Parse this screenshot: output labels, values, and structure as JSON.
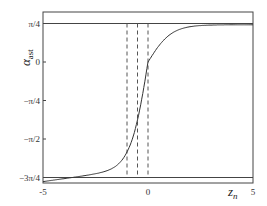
{
  "chart_data": {
    "type": "line",
    "title": "",
    "xlabel": "z_n",
    "ylabel": "α_ast",
    "xlim": [
      -5,
      5
    ],
    "ylim": [
      -2.55,
      0.95
    ],
    "x_ticks": [
      "-5",
      "0",
      "5"
    ],
    "y_ticks": [
      "π/4",
      "0",
      "−π/4",
      "−π/2",
      "−3π/4"
    ],
    "y_tick_values": [
      0.7854,
      0,
      -0.7854,
      -1.5708,
      -2.3562
    ],
    "horizontal_lines": [
      0.7854,
      -2.3562
    ],
    "vertical_dashed_lines": [
      -1.0,
      -0.5,
      0
    ],
    "series": [
      {
        "name": "alpha_ast",
        "x": [
          -5,
          -4,
          -3,
          -2,
          -1.5,
          -1,
          -0.5,
          0,
          0.5,
          1,
          2,
          3,
          4,
          5
        ],
        "y": [
          -2.13,
          -2.07,
          -1.98,
          -1.82,
          -1.68,
          -1.4,
          -0.75,
          0.0,
          0.35,
          0.5,
          0.62,
          0.68,
          0.71,
          0.73
        ]
      }
    ],
    "grid": false,
    "legend": "none"
  },
  "labels": {
    "ylabel_main": "α",
    "ylabel_sub": "ast",
    "xlabel_main": "z",
    "xlabel_sub": "n"
  }
}
